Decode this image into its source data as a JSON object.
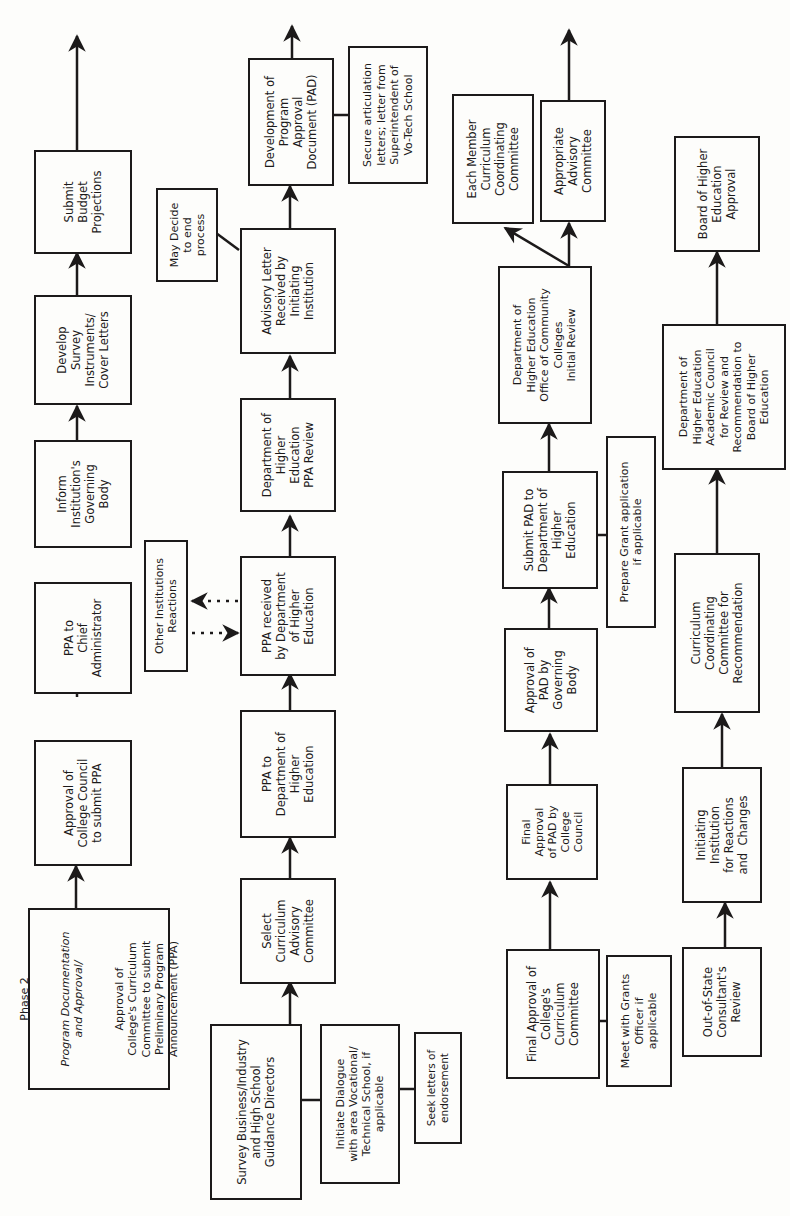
{
  "diagram": {
    "title": "Phase 2 Program Documentation and Approval",
    "orientation": "rotated-90-ccw",
    "stroke_color": "#1c1a1a",
    "background": "#fdfdfb",
    "columns": [
      {
        "id": "col1",
        "boxes": [
          {
            "id": "b1",
            "heading": "Phase 2",
            "subtitle": "Program Documentation\nand Approval/",
            "label": "Approval of\nCollege's Curriculum\nCommittee to submit\nPreliminary Program\nAnnouncement (PPA)"
          },
          {
            "id": "b2",
            "label": "Approval of\nCollege Council\nto submit PPA"
          },
          {
            "id": "b3",
            "label": "PPA to\nChief\nAdministrator"
          },
          {
            "id": "b4",
            "label": "Inform\nInstitution's\nGoverning\nBody"
          },
          {
            "id": "b5",
            "label": "Develop\nSurvey\nInstruments/\nCover Letters"
          },
          {
            "id": "b6",
            "label": "Submit\nBudget\nProjections"
          }
        ]
      },
      {
        "id": "col2",
        "boxes": [
          {
            "id": "b7",
            "label": "Survey Business/Industry\nand High School\nGuidance Directors"
          },
          {
            "id": "b7a",
            "label": "Initiate Dialogue\nwith area Vocational/\nTechnical School, if\napplicable"
          },
          {
            "id": "b7b",
            "label": "Seek letters of\nendorsement"
          },
          {
            "id": "b8",
            "label": "Select\nCurriculum\nAdvisory\nCommittee"
          },
          {
            "id": "b9",
            "label": "PPA to\nDepartment of\nHigher\nEducation"
          },
          {
            "id": "b10",
            "label": "PPA received\nby Department\nof Higher\nEducation"
          },
          {
            "id": "b10a",
            "label": "Other Institutions\nReactions"
          },
          {
            "id": "b11",
            "label": "Department of\nHigher\nEducation\nPPA Review"
          },
          {
            "id": "b12",
            "label": "Advisory Letter\nReceived by\nInitiating\nInstitution"
          },
          {
            "id": "b12a",
            "label": "May Decide\nto end\nprocess"
          },
          {
            "id": "b13",
            "label": "Development of\nProgram\nApproval\nDocument (PAD)"
          },
          {
            "id": "b13a",
            "label": "Secure articulation\nletters; letter from\nSuperintendent of\nVo-Tech School"
          }
        ]
      },
      {
        "id": "col3",
        "boxes": [
          {
            "id": "b14",
            "label": "Final Approval of\nCollege's\nCurriculum\nCommittee"
          },
          {
            "id": "b14a",
            "label": "Meet with Grants\nOfficer if\napplicable"
          },
          {
            "id": "b15",
            "label": "Final\nApproval\nof PAD by\nCollege\nCouncil"
          },
          {
            "id": "b16",
            "label": "Approval of\nPAD by\nGoverning\nBody"
          },
          {
            "id": "b17",
            "label": "Submit PAD to\nDepartment of\nHigher\nEducation"
          },
          {
            "id": "b17a",
            "label": "Prepare Grant application\nif applicable"
          },
          {
            "id": "b18",
            "label": "Department of\nHigher Education\nOffice of Community\nColleges\nInitial Review"
          },
          {
            "id": "b19",
            "label": "Each Member\nCurriculum\nCoordinating\nCommittee"
          },
          {
            "id": "b20",
            "label": "Appropriate\nAdvisory\nCommittee"
          }
        ]
      },
      {
        "id": "col4",
        "boxes": [
          {
            "id": "b21",
            "label": "Out-of-State\nConsultant's\nReview"
          },
          {
            "id": "b22",
            "label": "Initiating\nInstitution\nfor Reactions\nand  Changes"
          },
          {
            "id": "b23",
            "label": "Curriculum\nCoordinating\nCommittee for\nRecommendation"
          },
          {
            "id": "b24",
            "label": "Department of\nHigher Education\nAcademic Council\nfor Review and\nRecommendation to\nBoard of Higher\nEducation"
          },
          {
            "id": "b25",
            "label": "Board of Higher\nEducation\nApproval"
          }
        ]
      }
    ]
  }
}
